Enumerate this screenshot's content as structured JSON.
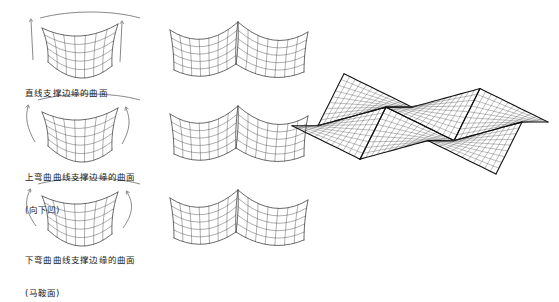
{
  "figure": {
    "background_color": "#ffffff",
    "line_color": "#3a3a3a",
    "bold_line_color": "#111111",
    "text_color": "#1a1a1a"
  },
  "rows": [
    {
      "id": "row-straight-edge",
      "label_lines": [
        "直线支撑边缘的曲面"
      ],
      "arrow_style": "straight",
      "arrow_count": 2,
      "edge_curve": "upper-arc",
      "grid_cols": 7,
      "grid_rows": 5
    },
    {
      "id": "row-upward-curved-edge",
      "label_lines": [
        "上弯曲曲线支撑边缘的曲面",
        "(向下凹)"
      ],
      "arrow_style": "curved",
      "arrow_count": 2,
      "edge_curve": "upper-arc",
      "grid_cols": 7,
      "grid_rows": 5
    },
    {
      "id": "row-downward-curved-edge",
      "label_lines": [
        "下弯曲曲线支撑边缘的曲面",
        "(马鞍面)"
      ],
      "arrow_style": "curved",
      "arrow_count": 2,
      "edge_curve": "upper-arc",
      "grid_cols": 7,
      "grid_rows": 5
    }
  ],
  "middle_column": {
    "name": "paired-module",
    "modules_per_figure": 2,
    "grid_cols": 7,
    "grid_rows": 5,
    "count": 3
  },
  "large_array": {
    "name": "hypar-roof-array",
    "modules_x": 3,
    "modules_y": 2,
    "grid_cols_per_module": 12,
    "grid_rows_per_module": 9,
    "bold_ridge_lines": true
  }
}
